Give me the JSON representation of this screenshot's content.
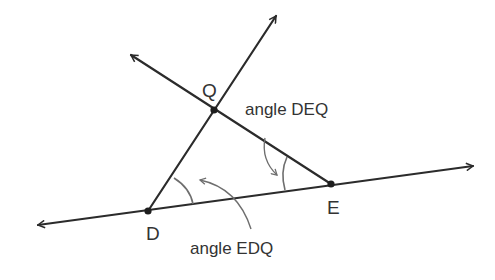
{
  "diagram": {
    "type": "geometry",
    "points": [
      {
        "id": "D",
        "label": "D",
        "x": 148,
        "y": 211
      },
      {
        "id": "E",
        "label": "E",
        "x": 331,
        "y": 184
      },
      {
        "id": "Q",
        "label": "Q",
        "x": 214,
        "y": 110
      }
    ],
    "lines": [
      {
        "id": "line-DE",
        "through": [
          "D",
          "E"
        ],
        "arrows": "both"
      },
      {
        "id": "ray-DQ",
        "from": "D",
        "through": "Q",
        "arrows": "end"
      },
      {
        "id": "ray-EQ",
        "from": "E",
        "through": "Q",
        "arrows": "end"
      }
    ],
    "angle_labels": {
      "deq": "angle DEQ",
      "edq": "angle EDQ"
    },
    "point_labels": {
      "d": "D",
      "e": "E",
      "q": "Q"
    },
    "colors": {
      "line": "#2b2b2b",
      "arc": "#6e6e6e",
      "text": "#333333",
      "background": "#ffffff"
    }
  }
}
